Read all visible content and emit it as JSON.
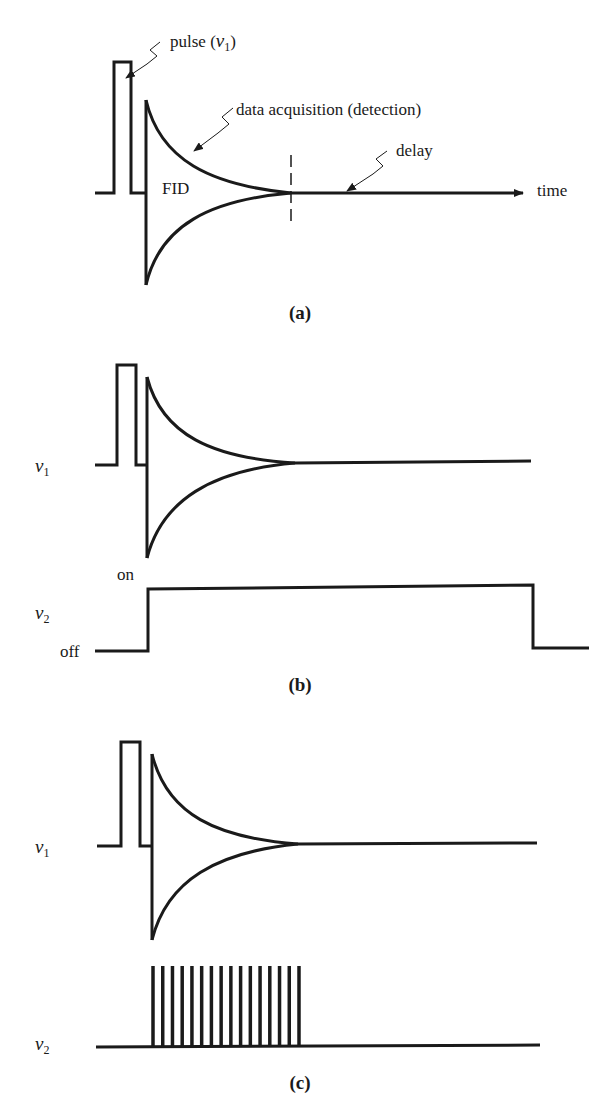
{
  "figure": {
    "ink_color": "#1a1a1a",
    "background": "#ffffff",
    "panels": [
      {
        "id": "a",
        "caption": "(a)",
        "labels": {
          "pulse": "pulse (",
          "pulse_symbol": "ν",
          "pulse_sub": "1",
          "pulse_close": ")",
          "acquisition": "data acquisition (detection)",
          "fid": "FID",
          "delay": "delay",
          "time": "time"
        }
      },
      {
        "id": "b",
        "caption": "(b)",
        "labels": {
          "channel1_symbol": "ν",
          "channel1_sub": "1",
          "channel2_symbol": "ν",
          "channel2_sub": "2",
          "on": "on",
          "off": "off"
        },
        "decoupler_mode": "continuous (on during pulse-to-end)"
      },
      {
        "id": "c",
        "caption": "(c)",
        "labels": {
          "channel1_symbol": "ν",
          "channel1_sub": "1",
          "channel2_symbol": "ν",
          "channel2_sub": "2"
        },
        "decoupler_mode": "gated pulses during acquisition",
        "gated_pulse_count": 16
      }
    ]
  }
}
